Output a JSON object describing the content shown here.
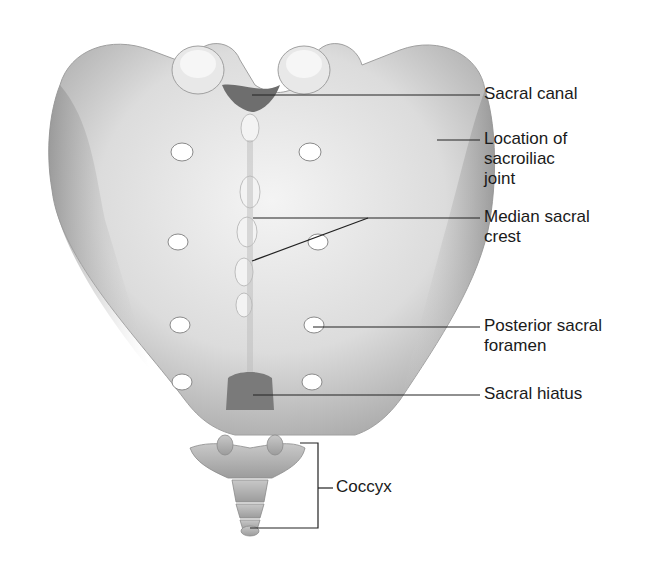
{
  "figure": {
    "colors": {
      "bone_light": "#f2f2f2",
      "bone_mid": "#cfcfcf",
      "bone_shadow": "#9a9a9a",
      "foramen": "#ffffff",
      "leader_line": "#222222",
      "text": "#1a1a1a"
    }
  },
  "labels": [
    {
      "id": "sacral-canal",
      "text": "Sacral canal"
    },
    {
      "id": "sacroiliac-joint",
      "text": "Location of\nsacroiliac\njoint"
    },
    {
      "id": "median-sacral-crest",
      "text": "Median sacral\ncrest"
    },
    {
      "id": "posterior-sacral-foramen",
      "text": "Posterior sacral\nforamen"
    },
    {
      "id": "sacral-hiatus",
      "text": "Sacral hiatus"
    },
    {
      "id": "coccyx",
      "text": "Coccyx"
    }
  ]
}
